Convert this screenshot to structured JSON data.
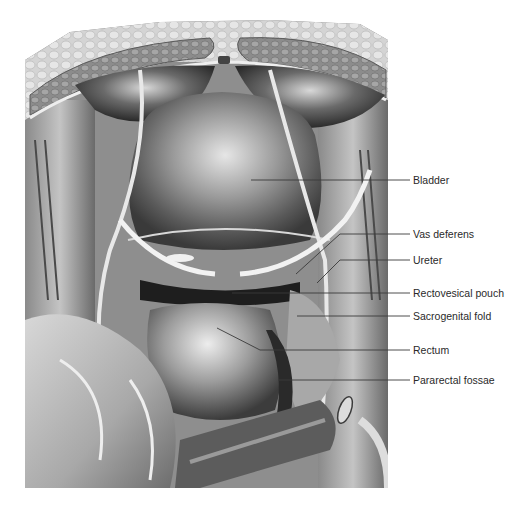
{
  "figure": {
    "type": "anatomical-illustration",
    "style": "grayscale pencil rendering"
  },
  "labels": [
    {
      "text": "Bladder",
      "y": 180,
      "line_start_x": 251,
      "bend": null
    },
    {
      "text": "Vas deferens",
      "y": 234,
      "line_start_x": 340,
      "bend": [
        296,
        274
      ]
    },
    {
      "text": "Ureter",
      "y": 260,
      "line_start_x": 340,
      "bend": [
        317,
        283
      ]
    },
    {
      "text": "Rectovesical pouch",
      "y": 293,
      "line_start_x": 232,
      "bend": null
    },
    {
      "text": "Sacrogenital fold",
      "y": 316,
      "line_start_x": 297,
      "bend": null
    },
    {
      "text": "Rectum",
      "y": 350,
      "line_start_x": 260,
      "bend": [
        217,
        328
      ]
    },
    {
      "text": "Pararectal fossae",
      "y": 380,
      "line_start_x": 278,
      "bend": null
    }
  ],
  "label_text_x": 413,
  "leader_end_x": 410,
  "colors": {
    "background": "#ffffff",
    "leader_line": "#3a3a3a",
    "label_text": "#2a2a2a"
  },
  "caption": {
    "visible": "clipped",
    "text": ""
  }
}
